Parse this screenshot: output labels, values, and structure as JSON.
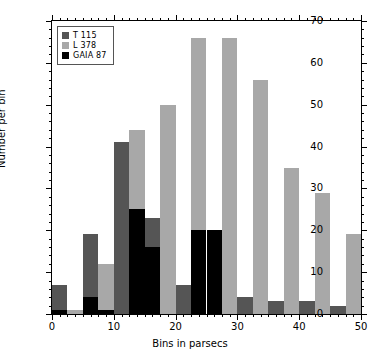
{
  "chart_data": {
    "type": "bar",
    "title": "",
    "xlabel": "Bins  in parsecs",
    "ylabel": "Number per bin",
    "xlim": [
      0,
      50
    ],
    "ylim": [
      0,
      70
    ],
    "xticks": [
      0,
      10,
      20,
      30,
      40,
      50
    ],
    "yticks": [
      0,
      10,
      20,
      30,
      40,
      50,
      60,
      70
    ],
    "xtick_labels": [
      "0",
      "10",
      "20",
      "30",
      "40",
      "50"
    ],
    "ytick_labels": [
      "0",
      "10",
      "20",
      "30",
      "40",
      "50",
      "60",
      "70"
    ],
    "grid": false,
    "legend_position": "upper left",
    "bin_width": 2.5,
    "bin_starts": [
      0,
      2.5,
      5,
      7.5,
      10,
      12.5,
      15,
      17.5,
      20,
      22.5,
      25,
      27.5,
      30,
      32.5,
      35,
      37.5,
      40,
      42.5,
      45,
      47.5
    ],
    "series": [
      {
        "name": "T  115",
        "color": "#555555",
        "values": [
          7,
          0,
          19,
          0,
          41,
          0,
          23,
          0,
          7,
          0,
          9,
          0,
          4,
          0,
          3,
          0,
          3,
          0,
          2,
          0
        ]
      },
      {
        "name": "L  378",
        "color": "#a8a8a8",
        "values": [
          0,
          1,
          0,
          12,
          0,
          44,
          0,
          50,
          0,
          66,
          0,
          66,
          0,
          56,
          0,
          35,
          0,
          29,
          0,
          19
        ]
      },
      {
        "name": "GAIA  87",
        "color": "#000000",
        "values": [
          1,
          0,
          4,
          1,
          0,
          25,
          16,
          0,
          0,
          20,
          20,
          0,
          0,
          0,
          0,
          0,
          0,
          0,
          0,
          0
        ]
      }
    ]
  },
  "legend": {
    "entries": [
      {
        "label": "T  115",
        "swatch": "#555555"
      },
      {
        "label": "L  378",
        "swatch": "#a8a8a8"
      },
      {
        "label": "GAIA  87",
        "swatch": "#000000"
      }
    ]
  }
}
